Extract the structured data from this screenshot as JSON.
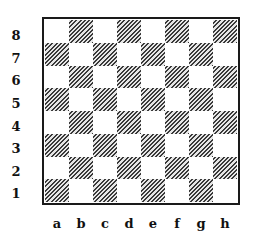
{
  "board": {
    "files": [
      "a",
      "b",
      "c",
      "d",
      "e",
      "f",
      "g",
      "h"
    ],
    "ranks": [
      "8",
      "7",
      "6",
      "5",
      "4",
      "3",
      "2",
      "1"
    ],
    "light_color": "#ffffff",
    "dark_pattern": "diagonal-hatch",
    "dark_hatch_color": "#3a3a3a",
    "border_color": "#1a1a1a",
    "bottom_left_square": "a1",
    "bottom_left_color": "dark"
  },
  "labels": {
    "rank_8": "8",
    "rank_7": "7",
    "rank_6": "6",
    "rank_5": "5",
    "rank_4": "4",
    "rank_3": "3",
    "rank_2": "2",
    "rank_1": "1",
    "file_a": "a",
    "file_b": "b",
    "file_c": "c",
    "file_d": "d",
    "file_e": "e",
    "file_f": "f",
    "file_g": "g",
    "file_h": "h"
  }
}
